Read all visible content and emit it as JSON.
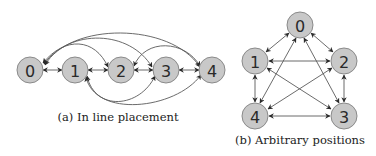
{
  "figure_a": {
    "caption": "(a) In line placement",
    "nodes": [
      {
        "id": "0",
        "label": "0",
        "x": 30,
        "y": 70
      },
      {
        "id": "1",
        "label": "1",
        "x": 75,
        "y": 70
      },
      {
        "id": "2",
        "label": "2",
        "x": 121,
        "y": 70
      },
      {
        "id": "3",
        "label": "3",
        "x": 166,
        "y": 70
      },
      {
        "id": "4",
        "label": "4",
        "x": 212,
        "y": 70
      }
    ],
    "edges": [
      {
        "from": "0",
        "to": "1",
        "type": "bidirectional"
      },
      {
        "from": "1",
        "to": "2",
        "type": "bidirectional"
      },
      {
        "from": "2",
        "to": "3",
        "type": "bidirectional"
      },
      {
        "from": "3",
        "to": "4",
        "type": "bidirectional"
      },
      {
        "from": "0",
        "to": "2",
        "type": "bidirectional",
        "route": "arc-above"
      },
      {
        "from": "0",
        "to": "3",
        "type": "bidirectional",
        "route": "arc-above"
      },
      {
        "from": "0",
        "to": "4",
        "type": "bidirectional",
        "route": "arc-above"
      },
      {
        "from": "2",
        "to": "4",
        "type": "bidirectional",
        "route": "arc-above"
      },
      {
        "from": "1",
        "to": "3",
        "type": "bidirectional",
        "route": "arc-below"
      },
      {
        "from": "1",
        "to": "4",
        "type": "bidirectional",
        "route": "arc-below"
      }
    ]
  },
  "figure_b": {
    "caption": "(b) Arbitrary positions",
    "nodes": [
      {
        "id": "0",
        "label": "0",
        "x": 300,
        "y": 25
      },
      {
        "id": "1",
        "label": "1",
        "x": 255,
        "y": 61
      },
      {
        "id": "2",
        "label": "2",
        "x": 344,
        "y": 61
      },
      {
        "id": "3",
        "label": "3",
        "x": 344,
        "y": 116
      },
      {
        "id": "4",
        "label": "4",
        "x": 255,
        "y": 116
      }
    ],
    "edges": [
      {
        "from": "0",
        "to": "1",
        "type": "bidirectional"
      },
      {
        "from": "0",
        "to": "2",
        "type": "bidirectional"
      },
      {
        "from": "0",
        "to": "3",
        "type": "bidirectional"
      },
      {
        "from": "0",
        "to": "4",
        "type": "bidirectional"
      },
      {
        "from": "1",
        "to": "2",
        "type": "bidirectional"
      },
      {
        "from": "1",
        "to": "3",
        "type": "bidirectional"
      },
      {
        "from": "1",
        "to": "4",
        "type": "bidirectional"
      },
      {
        "from": "2",
        "to": "3",
        "type": "bidirectional"
      },
      {
        "from": "2",
        "to": "4",
        "type": "bidirectional"
      },
      {
        "from": "3",
        "to": "4",
        "type": "bidirectional"
      }
    ]
  },
  "colors": {
    "node_fill": "#c8c8c8",
    "node_stroke": "#8a8a8a",
    "edge": "#5a5a5a",
    "text": "#222222"
  }
}
